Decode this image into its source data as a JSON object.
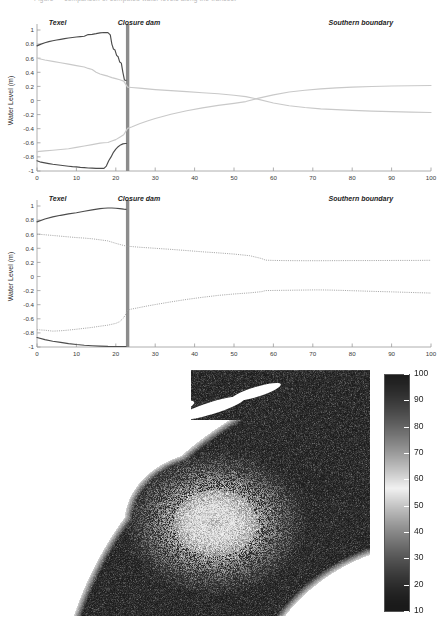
{
  "page": {
    "clipped_caption": "Figure — comparison of computed water levels along the transect"
  },
  "charts": [
    {
      "id": "chart-top",
      "chart_data": {
        "type": "line",
        "title": "",
        "xlabel": "Distance (Km)",
        "ylabel": "Water Level (m)",
        "xlim": [
          0,
          100
        ],
        "ylim": [
          -1,
          1
        ],
        "xticks": [
          0,
          10,
          20,
          30,
          40,
          50,
          60,
          70,
          80,
          90,
          100
        ],
        "yticks": [
          -1,
          -0.8,
          -0.6,
          -0.4,
          -0.2,
          0,
          0.2,
          0.4,
          0.6,
          0.8,
          1
        ],
        "xtick_labels": [
          "0",
          "10",
          "20",
          "30",
          "40",
          "50",
          "60",
          "70",
          "80",
          "90",
          "100"
        ],
        "ytick_labels": [
          "-1",
          "-0.8",
          "-0.6",
          "-0.4",
          "-0.2",
          "0",
          "0.2",
          "0.4",
          "0.6",
          "0.8",
          "1"
        ],
        "grid": false,
        "legend": "none",
        "annotations": [
          {
            "name": "texel-label",
            "text": "Texel",
            "x": 3,
            "y": 1.0
          },
          {
            "name": "closure-dam-label",
            "text": "Closure dam",
            "x": 20.5,
            "y": 1.0
          },
          {
            "name": "southern-boundary-label",
            "text": "Southern boundary",
            "x": 74,
            "y": 1.0
          }
        ],
        "markers": [
          {
            "name": "closure-dam-bar",
            "type": "vline",
            "x": 23.0,
            "width_km": 0.85,
            "color": "#8c8c8c"
          }
        ],
        "series": [
          {
            "name": "High water (west of dam)",
            "style": "solid-dark",
            "color": "#4c4c4c",
            "x": [
              0,
              1,
              2,
              3,
              4,
              5,
              6,
              7,
              8,
              9,
              10,
              11,
              12,
              13,
              14,
              15,
              16,
              17,
              18,
              18.6,
              19,
              19.4,
              19.8,
              20.2,
              20.6,
              21,
              21.4,
              21.8,
              22.2,
              22.6
            ],
            "y": [
              0.775,
              0.8,
              0.82,
              0.835,
              0.848,
              0.858,
              0.868,
              0.878,
              0.886,
              0.893,
              0.9,
              0.906,
              0.912,
              0.935,
              0.938,
              0.948,
              0.96,
              0.965,
              0.962,
              0.93,
              0.8,
              0.73,
              0.715,
              0.64,
              0.62,
              0.545,
              0.53,
              0.4,
              0.29,
              0.285
            ]
          },
          {
            "name": "Low water (west of dam)",
            "style": "solid-dark",
            "color": "#4c4c4c",
            "x": [
              0,
              1,
              2,
              3,
              4,
              5,
              6,
              7,
              8,
              9,
              10,
              11,
              12,
              13,
              14,
              15,
              16,
              17,
              17.6,
              18.2,
              18.8,
              19.4,
              20,
              20.6,
              21.2,
              21.8,
              22.4,
              22.7
            ],
            "y": [
              -0.855,
              -0.875,
              -0.885,
              -0.895,
              -0.905,
              -0.912,
              -0.918,
              -0.925,
              -0.932,
              -0.938,
              -0.942,
              -0.948,
              -0.952,
              -0.957,
              -0.96,
              -0.962,
              -0.963,
              -0.962,
              -0.93,
              -0.855,
              -0.8,
              -0.735,
              -0.69,
              -0.655,
              -0.63,
              -0.615,
              -0.61,
              -0.61
            ]
          },
          {
            "name": "High water (full domain)",
            "style": "solid-light",
            "color": "#c9c9c9",
            "x": [
              0,
              2,
              4,
              6,
              8,
              10,
              12,
              13,
              14,
              15,
              16,
              17,
              18,
              19,
              20,
              21,
              22,
              23,
              24,
              26,
              28,
              30,
              34,
              38,
              42,
              46,
              50,
              53,
              56,
              60,
              64,
              68,
              72,
              76,
              80,
              85,
              90,
              95,
              100
            ],
            "y": [
              0.6,
              0.575,
              0.555,
              0.535,
              0.515,
              0.495,
              0.475,
              0.455,
              0.44,
              0.4,
              0.375,
              0.36,
              0.345,
              0.325,
              0.31,
              0.295,
              0.275,
              0.19,
              0.185,
              0.175,
              0.165,
              0.155,
              0.14,
              0.125,
              0.11,
              0.095,
              0.075,
              0.055,
              0.02,
              -0.035,
              -0.075,
              -0.1,
              -0.118,
              -0.13,
              -0.14,
              -0.15,
              -0.158,
              -0.165,
              -0.17
            ]
          },
          {
            "name": "Low water (full domain)",
            "style": "solid-light",
            "color": "#c9c9c9",
            "x": [
              0,
              2,
              4,
              6,
              8,
              10,
              12,
              14,
              16,
              17,
              18,
              19,
              20,
              21,
              22,
              23,
              24,
              26,
              28,
              30,
              34,
              38,
              42,
              46,
              50,
              53,
              56,
              60,
              64,
              68,
              72,
              76,
              80,
              85,
              90,
              95,
              100
            ],
            "y": [
              -0.725,
              -0.715,
              -0.705,
              -0.695,
              -0.685,
              -0.665,
              -0.645,
              -0.625,
              -0.605,
              -0.6,
              -0.595,
              -0.575,
              -0.555,
              -0.52,
              -0.485,
              -0.395,
              -0.375,
              -0.33,
              -0.29,
              -0.255,
              -0.195,
              -0.145,
              -0.105,
              -0.07,
              -0.04,
              -0.015,
              0.03,
              0.08,
              0.12,
              0.145,
              0.165,
              0.18,
              0.19,
              0.198,
              0.205,
              0.21,
              0.212
            ]
          }
        ]
      }
    },
    {
      "id": "chart-bottom",
      "chart_data": {
        "type": "line",
        "title": "",
        "xlabel": "Distance (Km)",
        "ylabel": "Water Level (m)",
        "xlim": [
          0,
          100
        ],
        "ylim": [
          -1,
          1
        ],
        "xticks": [
          0,
          10,
          20,
          30,
          40,
          50,
          60,
          70,
          80,
          90,
          100
        ],
        "yticks": [
          -1,
          -0.8,
          -0.6,
          -0.4,
          -0.2,
          0,
          0.2,
          0.4,
          0.6,
          0.8,
          1
        ],
        "xtick_labels": [
          "0",
          "10",
          "20",
          "30",
          "40",
          "50",
          "60",
          "70",
          "80",
          "90",
          "100"
        ],
        "ytick_labels": [
          "-1",
          "-0.8",
          "-0.6",
          "-0.4",
          "-0.2",
          "0",
          "0.2",
          "0.4",
          "0.6",
          "0.8",
          "1"
        ],
        "grid": false,
        "legend": "none",
        "annotations": [
          {
            "name": "texel-label",
            "text": "Texel",
            "x": 3,
            "y": 1.0
          },
          {
            "name": "closure-dam-label",
            "text": "Closure dam",
            "x": 20.5,
            "y": 1.0
          },
          {
            "name": "southern-boundary-label",
            "text": "Southern boundary",
            "x": 74,
            "y": 1.0
          }
        ],
        "markers": [
          {
            "name": "closure-dam-bar",
            "type": "vline",
            "x": 23.0,
            "width_km": 0.85,
            "color": "#8c8c8c"
          }
        ],
        "series": [
          {
            "name": "High water (west of dam)",
            "style": "solid-dark",
            "color": "#4c4c4c",
            "x": [
              0,
              2,
              4,
              6,
              8,
              10,
              12,
              14,
              16,
              17,
              18,
              19,
              20,
              21,
              22,
              22.6
            ],
            "y": [
              0.775,
              0.815,
              0.845,
              0.868,
              0.888,
              0.905,
              0.925,
              0.945,
              0.962,
              0.968,
              0.972,
              0.972,
              0.968,
              0.962,
              0.955,
              0.952
            ]
          },
          {
            "name": "Low water (west of dam)",
            "style": "solid-dark",
            "color": "#4c4c4c",
            "x": [
              0,
              2,
              4,
              6,
              8,
              10,
              12,
              14,
              16,
              18,
              20,
              21,
              22,
              22.6
            ],
            "y": [
              -0.865,
              -0.895,
              -0.918,
              -0.935,
              -0.952,
              -0.965,
              -0.975,
              -0.982,
              -0.988,
              -0.992,
              -0.993,
              -0.993,
              -0.993,
              -0.993
            ]
          },
          {
            "name": "High water (full domain)",
            "style": "dotted",
            "color": "#9a9a9a",
            "x": [
              0,
              2,
              4,
              6,
              8,
              10,
              12,
              14,
              16,
              18,
              20,
              22,
              23,
              24,
              26,
              28,
              30,
              34,
              38,
              42,
              46,
              50,
              54,
              57,
              58,
              60,
              64,
              68,
              72,
              76,
              80,
              84,
              88,
              92,
              96,
              100
            ],
            "y": [
              0.6,
              0.592,
              0.582,
              0.572,
              0.562,
              0.552,
              0.545,
              0.535,
              0.52,
              0.505,
              0.47,
              0.44,
              0.428,
              0.425,
              0.415,
              0.408,
              0.4,
              0.385,
              0.368,
              0.35,
              0.335,
              0.318,
              0.295,
              0.255,
              0.232,
              0.228,
              0.225,
              0.224,
              0.224,
              0.225,
              0.226,
              0.226,
              0.227,
              0.228,
              0.228,
              0.23
            ]
          },
          {
            "name": "Low water (full domain)",
            "style": "dotted",
            "color": "#9a9a9a",
            "x": [
              0,
              2,
              4,
              6,
              8,
              10,
              12,
              14,
              16,
              18,
              20,
              21,
              22,
              22.5,
              23,
              24,
              26,
              28,
              30,
              34,
              38,
              42,
              46,
              50,
              54,
              57,
              58,
              60,
              64,
              68,
              71,
              74,
              78,
              82,
              86,
              90,
              94,
              100
            ],
            "y": [
              -0.755,
              -0.762,
              -0.775,
              -0.77,
              -0.76,
              -0.748,
              -0.735,
              -0.722,
              -0.705,
              -0.69,
              -0.665,
              -0.64,
              -0.585,
              -0.535,
              -0.475,
              -0.462,
              -0.44,
              -0.418,
              -0.398,
              -0.36,
              -0.325,
              -0.295,
              -0.268,
              -0.248,
              -0.232,
              -0.215,
              -0.2,
              -0.198,
              -0.195,
              -0.192,
              -0.19,
              -0.192,
              -0.198,
              -0.205,
              -0.212,
              -0.218,
              -0.225,
              -0.235
            ]
          }
        ]
      }
    }
  ],
  "map": {
    "name": "wadden-sea-field-map",
    "colorbar": {
      "name": "colorbar",
      "orientation": "vertical",
      "min": 10,
      "max": 100,
      "ticks": [
        10,
        20,
        30,
        40,
        50,
        60,
        70,
        80,
        90,
        100
      ],
      "tick_labels": [
        "10",
        "20",
        "30",
        "40",
        "50",
        "60",
        "70",
        "80",
        "90",
        "100"
      ],
      "colormap": "grayscale-jet"
    }
  }
}
